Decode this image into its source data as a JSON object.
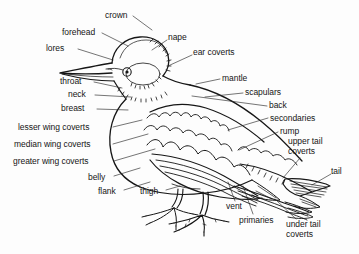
{
  "diagram": {
    "style": "black-and-white line drawing with leader lines",
    "background_color": "#fdfdfd",
    "ink_color": "#161616"
  },
  "labels": [
    {
      "id": "crown",
      "text": "crown",
      "align": "left",
      "x": 105,
      "y": 11,
      "line": [
        [
          133,
          16
        ],
        [
          152,
          30
        ]
      ]
    },
    {
      "id": "forehead",
      "text": "forehead",
      "align": "right",
      "x": 62,
      "y": 28,
      "line": [
        [
          102,
          33
        ],
        [
          128,
          46
        ]
      ]
    },
    {
      "id": "lores",
      "text": "lores",
      "align": "right",
      "x": 46,
      "y": 44,
      "line": [
        [
          78,
          49
        ],
        [
          113,
          60
        ]
      ]
    },
    {
      "id": "throat",
      "text": "throat",
      "align": "right",
      "x": 60,
      "y": 77,
      "line": [
        [
          94,
          82
        ],
        [
          122,
          88
        ]
      ]
    },
    {
      "id": "neck",
      "text": "neck",
      "align": "right",
      "x": 68,
      "y": 90,
      "line": [
        [
          95,
          95
        ],
        [
          131,
          97
        ]
      ]
    },
    {
      "id": "breast",
      "text": "breast",
      "align": "right",
      "x": 61,
      "y": 104,
      "line": [
        [
          97,
          109
        ],
        [
          128,
          110
        ]
      ]
    },
    {
      "id": "lesser-wing-coverts",
      "text": "lesser wing coverts",
      "align": "right",
      "x": 18,
      "y": 123,
      "line": [
        [
          113,
          127
        ],
        [
          142,
          120
        ]
      ]
    },
    {
      "id": "median-wing-coverts",
      "text": "median wing coverts",
      "align": "right",
      "x": 14,
      "y": 140,
      "line": [
        [
          113,
          144
        ],
        [
          148,
          134
        ]
      ]
    },
    {
      "id": "greater-wing-coverts",
      "text": "greater wing coverts",
      "align": "right",
      "x": 13,
      "y": 157,
      "line": [
        [
          114,
          161
        ],
        [
          155,
          149
        ]
      ]
    },
    {
      "id": "belly",
      "text": "belly",
      "align": "right",
      "x": 88,
      "y": 173,
      "line": [
        [
          114,
          176
        ],
        [
          140,
          168
        ]
      ]
    },
    {
      "id": "flank",
      "text": "flank",
      "align": "right",
      "x": 98,
      "y": 187,
      "line": [
        [
          124,
          190
        ],
        [
          150,
          182
        ]
      ]
    },
    {
      "id": "thigh",
      "text": "thigh",
      "align": "left",
      "x": 140,
      "y": 187,
      "line": [
        [
          166,
          190
        ],
        [
          180,
          186
        ]
      ]
    },
    {
      "id": "nape",
      "text": "nape",
      "align": "left",
      "x": 168,
      "y": 33,
      "line": [
        [
          167,
          40
        ],
        [
          152,
          50
        ]
      ]
    },
    {
      "id": "ear-coverts",
      "text": "ear coverts",
      "align": "left",
      "x": 193,
      "y": 48,
      "line": [
        [
          192,
          55
        ],
        [
          168,
          66
        ]
      ]
    },
    {
      "id": "mantle",
      "text": "mantle",
      "align": "left",
      "x": 222,
      "y": 74,
      "line": [
        [
          220,
          79
        ],
        [
          196,
          84
        ]
      ]
    },
    {
      "id": "scapulars",
      "text": "scapulars",
      "align": "left",
      "x": 245,
      "y": 88,
      "line": [
        [
          243,
          93
        ],
        [
          205,
          97
        ]
      ]
    },
    {
      "id": "back",
      "text": "back",
      "align": "left",
      "x": 269,
      "y": 101,
      "line": [
        [
          267,
          106
        ],
        [
          192,
          96
        ]
      ]
    },
    {
      "id": "secondaries",
      "text": "secondaries",
      "align": "left",
      "x": 270,
      "y": 114,
      "line": [
        [
          268,
          118
        ],
        [
          228,
          130
        ]
      ]
    },
    {
      "id": "rump",
      "text": "rump",
      "align": "left",
      "x": 280,
      "y": 127,
      "line": [
        [
          278,
          132
        ],
        [
          239,
          150
        ]
      ]
    },
    {
      "id": "upper-tail-coverts",
      "text": "upper tail coverts",
      "align": "left",
      "x": 288,
      "y": 137,
      "width": 52,
      "line": [
        [
          300,
          158
        ],
        [
          283,
          178
        ]
      ]
    },
    {
      "id": "tail",
      "text": "tail",
      "align": "left",
      "x": 331,
      "y": 167,
      "line": [
        [
          331,
          174
        ],
        [
          312,
          185
        ]
      ]
    },
    {
      "id": "vent",
      "text": "vent",
      "align": "left",
      "x": 226,
      "y": 202,
      "line": [
        [
          235,
          201
        ],
        [
          228,
          182
        ]
      ]
    },
    {
      "id": "primaries",
      "text": "primaries",
      "align": "left",
      "x": 239,
      "y": 216,
      "line": [
        [
          253,
          214
        ],
        [
          243,
          186
        ]
      ]
    },
    {
      "id": "under-tail-coverts",
      "text": "under tail coverts",
      "align": "left",
      "x": 286,
      "y": 220,
      "width": 50,
      "line": [
        [
          296,
          219
        ],
        [
          275,
          199
        ]
      ]
    }
  ]
}
